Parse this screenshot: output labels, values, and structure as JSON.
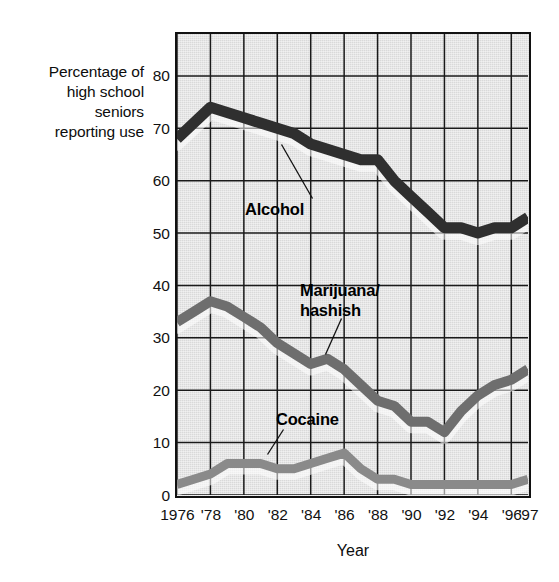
{
  "figure": {
    "y_axis_caption_lines": [
      "Percentage of",
      "high school",
      "seniors",
      "reporting use"
    ],
    "x_axis_title": "Year"
  },
  "axis": {
    "y_ticks": [
      "0",
      "10",
      "20",
      "30",
      "40",
      "50",
      "60",
      "70",
      "80"
    ],
    "x_ticks": [
      "1976",
      "'78",
      "'80",
      "'82",
      "'84",
      "'86",
      "'88",
      "'90",
      "'92",
      "'94",
      "'96",
      "'97"
    ]
  },
  "annotations": {
    "alcohol": "Alcohol",
    "marijuana": "Marijuana/\nhashish",
    "cocaine": "Cocaine"
  },
  "colors": {
    "plot_background": "#d9d9d9",
    "frame": "#111111",
    "gridline": "#1a1a1a",
    "alcohol_band": "#2f2f2f",
    "marijuana_band": "#6e6e6e",
    "cocaine_band": "#8a8a8a",
    "text": "#0d0d0d"
  },
  "chart_data": {
    "type": "line",
    "title": "",
    "subtitle": "",
    "xlabel": "Year",
    "ylabel": "Percentage of high school seniors reporting use",
    "xlim": [
      1976,
      1997
    ],
    "ylim": [
      0,
      88
    ],
    "yticks": [
      0,
      10,
      20,
      30,
      40,
      50,
      60,
      70,
      80
    ],
    "xticks": [
      1976,
      1978,
      1980,
      1982,
      1984,
      1986,
      1988,
      1990,
      1992,
      1994,
      1996,
      1997
    ],
    "grid": true,
    "legend": "inline-annotations",
    "x": [
      1976,
      1977,
      1978,
      1979,
      1980,
      1981,
      1982,
      1983,
      1984,
      1985,
      1986,
      1987,
      1988,
      1989,
      1990,
      1991,
      1992,
      1993,
      1994,
      1995,
      1996,
      1997
    ],
    "series": [
      {
        "name": "Alcohol",
        "color": "#2f2f2f",
        "values": [
          68,
          71,
          74,
          73,
          72,
          71,
          70,
          69,
          67,
          66,
          65,
          64,
          64,
          60,
          57,
          54,
          51,
          51,
          50,
          51,
          51,
          53
        ]
      },
      {
        "name": "Marijuana/hashish",
        "color": "#6e6e6e",
        "values": [
          33,
          35,
          37,
          36,
          34,
          32,
          29,
          27,
          25,
          26,
          24,
          21,
          18,
          17,
          14,
          14,
          12,
          16,
          19,
          21,
          22,
          24
        ]
      },
      {
        "name": "Cocaine",
        "color": "#8a8a8a",
        "values": [
          2,
          3,
          4,
          6,
          6,
          6,
          5,
          5,
          6,
          7,
          8,
          5,
          3,
          3,
          2,
          2,
          2,
          2,
          2,
          2,
          2,
          3
        ]
      }
    ]
  }
}
